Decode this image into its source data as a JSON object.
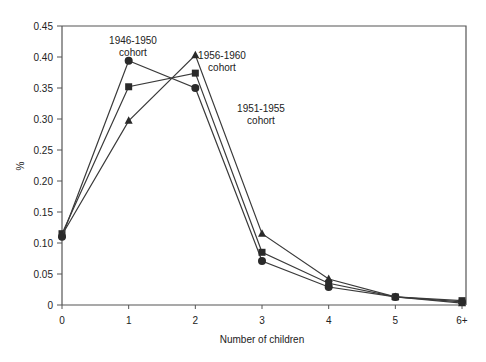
{
  "chart_data": {
    "type": "line",
    "title": "",
    "xlabel": "Number of children",
    "ylabel": "%",
    "x": [
      "0",
      "1",
      "2",
      "3",
      "4",
      "5",
      "6+"
    ],
    "ylim": [
      0,
      0.45
    ],
    "yticks": [
      "0",
      "0.05",
      "0.10",
      "0.15",
      "0.20",
      "0.25",
      "0.30",
      "0.35",
      "0.40",
      "0.45"
    ],
    "grid": false,
    "legend": "inline annotations",
    "series": [
      {
        "name": "1946-1950 cohort",
        "marker": "circle",
        "values": [
          0.11,
          0.394,
          0.35,
          0.071,
          0.029,
          0.013,
          0.005
        ]
      },
      {
        "name": "1951-1955 cohort",
        "marker": "square",
        "values": [
          0.115,
          0.352,
          0.374,
          0.085,
          0.035,
          0.013,
          0.007
        ]
      },
      {
        "name": "1956-1960 cohort",
        "marker": "triangle",
        "values": [
          0.113,
          0.297,
          0.403,
          0.115,
          0.042,
          0.013,
          0.003
        ]
      }
    ],
    "annotations": [
      {
        "line1": "1946-1950",
        "line2": "cohort",
        "series": "1946-1950 cohort"
      },
      {
        "line1": "1956-1960",
        "line2": "cohort",
        "series": "1956-1960 cohort"
      },
      {
        "line1": "1951-1955",
        "line2": "cohort",
        "series": "1951-1955 cohort"
      }
    ]
  },
  "colors": {
    "line": "#3a3a3a",
    "marker": "#2a2a2a",
    "axis": "#555555",
    "background": "#ffffff"
  }
}
